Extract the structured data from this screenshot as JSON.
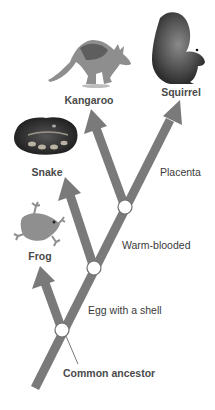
{
  "diagram": {
    "type": "cladogram",
    "colors": {
      "branch": "#7a7a7a",
      "node_fill": "#ffffff",
      "node_stroke": "#6e6e6e",
      "text": "#3a3a3a"
    },
    "taxa": [
      {
        "id": "kangaroo",
        "label": "Kangaroo",
        "image": "kangaroo-photo"
      },
      {
        "id": "squirrel",
        "label": "Squirrel",
        "image": "squirrel-photo"
      },
      {
        "id": "snake",
        "label": "Snake",
        "image": "snake-photo"
      },
      {
        "id": "frog",
        "label": "Frog",
        "image": "frog-photo"
      }
    ],
    "traits": [
      {
        "id": "placenta",
        "label": "Placenta"
      },
      {
        "id": "warm_blooded",
        "label": "Warm-blooded"
      },
      {
        "id": "egg_shell",
        "label": "Egg with a shell"
      }
    ],
    "root": {
      "label": "Common ancestor"
    }
  }
}
